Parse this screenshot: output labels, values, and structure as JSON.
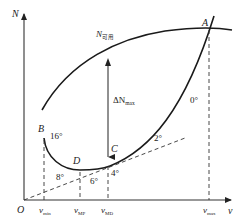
{
  "diagram": {
    "type": "power-curve-diagram",
    "axes": {
      "y_label": "N",
      "x_label": "v",
      "origin_label": "O"
    },
    "curves": {
      "available": {
        "label": "N",
        "label_sub": "可用"
      },
      "required": {
        "description": "power required curve from B through D, C to A"
      }
    },
    "points": [
      {
        "id": "A",
        "label": "A"
      },
      {
        "id": "B",
        "label": "B"
      },
      {
        "id": "C",
        "label": "C"
      },
      {
        "id": "D",
        "label": "D"
      }
    ],
    "angles": [
      {
        "label": "16°"
      },
      {
        "label": "8°"
      },
      {
        "label": "6°"
      },
      {
        "label": "4°"
      },
      {
        "label": "2°"
      },
      {
        "label": "0°"
      }
    ],
    "delta": {
      "label": "ΔN",
      "label_sub": "max"
    },
    "x_ticks": [
      {
        "main": "v",
        "sub": "min"
      },
      {
        "main": "v",
        "sub": "MP"
      },
      {
        "main": "v",
        "sub": "MD"
      },
      {
        "main": "v",
        "sub": "max"
      }
    ]
  }
}
